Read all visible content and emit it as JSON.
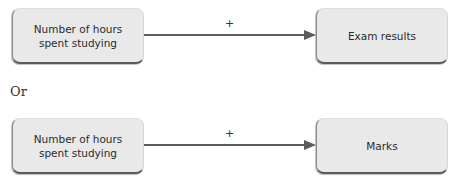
{
  "diagrams": [
    {
      "source": {
        "label": "Number of hours spent studying"
      },
      "edge": {
        "label": "+"
      },
      "target": {
        "label": "Exam results"
      }
    },
    {
      "source": {
        "label": "Number of hours spent studying"
      },
      "edge": {
        "label": "+"
      },
      "target": {
        "label": "Marks"
      }
    }
  ],
  "separator": {
    "label": "Or"
  },
  "colors": {
    "node_fill": "#e9e9e9",
    "node_shadow": "#5a5a5a",
    "edge": "#5c5c5c",
    "text": "#2b2b2b"
  }
}
